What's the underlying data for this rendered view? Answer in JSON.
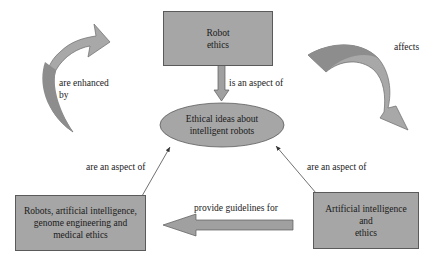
{
  "diagram": {
    "colors": {
      "node_fill": "#a6a6a6",
      "node_border": "#5a5a5a",
      "arrow_fill": "#a0a0a0",
      "line": "#333333"
    },
    "nodes": {
      "robot_ethics": {
        "line1": "Robot",
        "line2": "ethics"
      },
      "center": {
        "line1": "Ethical ideas about",
        "line2": "intelligent robots"
      },
      "robots_ai_genome": {
        "line1": "Robots, artificial intelligence,",
        "line2": "genome engineering and",
        "line3": "medical ethics"
      },
      "ai_ethics": {
        "line1": "Artificial intelligence",
        "line2": "and",
        "line3": "ethics"
      }
    },
    "edges": {
      "is_aspect": "is an aspect of",
      "enhanced_line1": "are enhanced",
      "enhanced_line2": "by",
      "affects": "affects",
      "left_aspect": "are an aspect of",
      "right_aspect": "are an aspect of",
      "guidelines": "provide guidelines for"
    }
  }
}
